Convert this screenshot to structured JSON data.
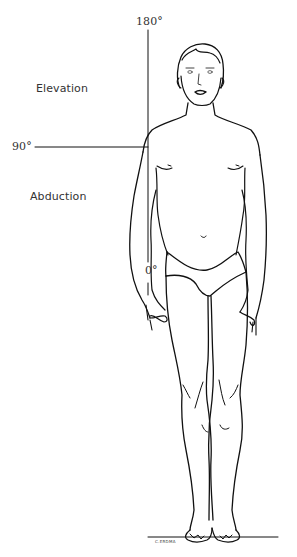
{
  "diagram": {
    "labels": {
      "elevation": "Elevation",
      "abduction": "Abduction"
    },
    "angle_markers": {
      "top": "180°",
      "middle": "90°",
      "bottom": "0°"
    },
    "signature": "C.ERDMA",
    "colors": {
      "line": "#111111",
      "text": "#333333",
      "background": "#ffffff"
    }
  }
}
